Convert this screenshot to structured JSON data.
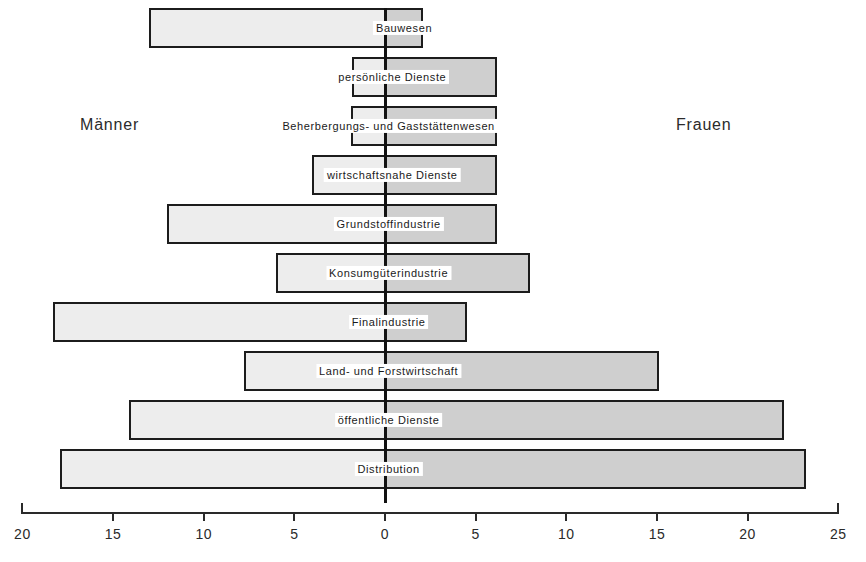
{
  "chart_data": {
    "type": "bar",
    "subtype": "diverging-population-pyramid",
    "title": "",
    "subtitle": "",
    "xlabel": "",
    "ylabel": "",
    "grid": false,
    "legend_position": "inline-side-captions",
    "left_side_label": "Männer",
    "right_side_label": "Frauen",
    "axis": {
      "left_max": 20,
      "right_max": 25,
      "tick_step": 5,
      "left_ticks": [
        20,
        15,
        10,
        5,
        0
      ],
      "right_ticks": [
        5,
        10,
        15,
        20,
        25
      ],
      "tick_labels": [
        "20",
        "15",
        "10",
        "5",
        "0",
        "5",
        "10",
        "15",
        "20",
        "25"
      ]
    },
    "categories": [
      "Bauwesen",
      "persönliche Dienste",
      "Beherbergungs- und Gaststättenwesen",
      "wirtschaftsnahe Dienste",
      "Grundstoffindustrie",
      "Konsumgüterindustrie",
      "Finalindustrie",
      "Land- und Forstwirtschaft",
      "öffentliche Dienste",
      "Distribution"
    ],
    "series": [
      {
        "name": "Männer",
        "side": "left",
        "color": "#ededed",
        "values": [
          13.0,
          1.8,
          1.9,
          4.0,
          12.0,
          6.0,
          18.3,
          7.8,
          14.1,
          17.9
        ]
      },
      {
        "name": "Frauen",
        "side": "right",
        "color": "#cfcfcf",
        "values": [
          2.1,
          6.2,
          6.2,
          6.2,
          6.2,
          8.0,
          4.5,
          15.1,
          22.0,
          23.2
        ]
      }
    ],
    "rows": [
      {
        "label": "Bauwesen",
        "male": 13.0,
        "female": 2.1,
        "label_anchor": 1.05
      },
      {
        "label": "persönliche Dienste",
        "male": 1.8,
        "female": 6.2,
        "label_anchor": 0.4
      },
      {
        "label": "Beherbergungs- und Gaststättenwesen",
        "male": 1.9,
        "female": 6.2,
        "label_anchor": 0.2
      },
      {
        "label": "wirtschaftsnahe Dienste",
        "male": 4.0,
        "female": 6.2,
        "label_anchor": 0.4
      },
      {
        "label": "Grundstoffindustrie",
        "male": 12.0,
        "female": 6.2,
        "label_anchor": 0.2
      },
      {
        "label": "Konsumgüterindustrie",
        "male": 6.0,
        "female": 8.0,
        "label_anchor": 0.2
      },
      {
        "label": "Finalindustrie",
        "male": 18.3,
        "female": 4.5,
        "label_anchor": 0.2
      },
      {
        "label": "Land- und Forstwirtschaft",
        "male": 7.8,
        "female": 15.1,
        "label_anchor": 0.2
      },
      {
        "label": "öffentliche Dienste",
        "male": 14.1,
        "female": 22.0,
        "label_anchor": 0.2
      },
      {
        "label": "Distribution",
        "male": 17.9,
        "female": 23.2,
        "label_anchor": 0.2
      }
    ],
    "colors": {
      "male_fill": "#ededed",
      "female_fill": "#cfcfcf",
      "outline": "#1c1c1c",
      "axis": "#2a2a2a",
      "background": "#ffffff"
    }
  }
}
